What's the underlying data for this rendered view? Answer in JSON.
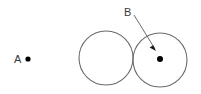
{
  "figure": {
    "background_color": "#ffffff",
    "stroke_color": "#6b6b6b",
    "point_color": "#000000",
    "text_color": "#3a3a3a",
    "width": 201,
    "height": 94,
    "labels": {
      "point_a": "A",
      "point_b": "B"
    },
    "points": {
      "a": {
        "x": 28,
        "y": 59,
        "radius": 2.6
      },
      "b": {
        "x": 160,
        "y": 59,
        "radius": 3.0
      }
    },
    "circles": [
      {
        "name": "left-circle",
        "cx": 106,
        "cy": 58,
        "r": 27
      },
      {
        "name": "right-circle",
        "cx": 160,
        "cy": 60,
        "r": 27
      }
    ],
    "label_positions": {
      "a": {
        "x": 14,
        "y": 63
      },
      "b": {
        "x": 124,
        "y": 16
      }
    },
    "arrow": {
      "x1": 134,
      "y1": 15,
      "x2": 155,
      "y2": 50,
      "head_size": 5
    }
  }
}
